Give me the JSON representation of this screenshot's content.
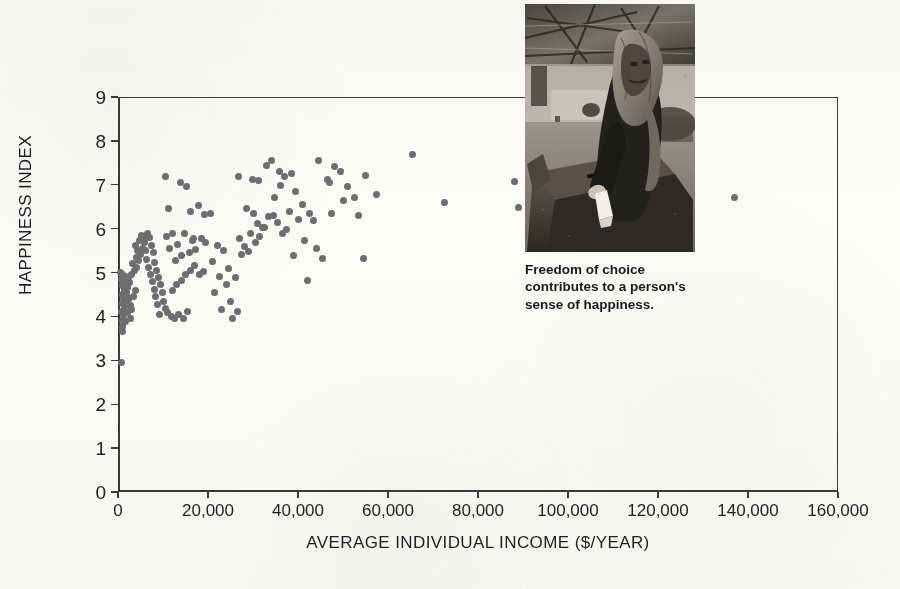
{
  "figure": {
    "photo": {
      "alt_name": "woman-casting-ballot-photo",
      "caption": "Freedom of choice\ncontributes to a person's\nsense of happiness."
    }
  },
  "chart_data": {
    "type": "scatter",
    "title": "",
    "xlabel": "AVERAGE INDIVIDUAL INCOME ($/YEAR)",
    "ylabel": "HAPPINESS INDEX",
    "xlim": [
      0,
      160000
    ],
    "ylim": [
      0,
      9
    ],
    "xticks": [
      0,
      20000,
      40000,
      60000,
      80000,
      100000,
      120000,
      140000,
      160000
    ],
    "xticklabels": [
      "0",
      "20,000",
      "40,000",
      "60,000",
      "80,000",
      "100,000",
      "120,000",
      "140,000",
      "160,000"
    ],
    "yticks": [
      0,
      1,
      2,
      3,
      4,
      5,
      6,
      7,
      8,
      9
    ],
    "yticklabels": [
      "0",
      "1",
      "2",
      "3",
      "4",
      "5",
      "6",
      "7",
      "8",
      "9"
    ],
    "grid": false,
    "legend": false,
    "marker_color": "#6e6e6e",
    "marker_size": 7,
    "points": [
      [
        700,
        2.95
      ],
      [
        900,
        3.65
      ],
      [
        1000,
        3.78
      ],
      [
        1100,
        3.9
      ],
      [
        1200,
        4.02
      ],
      [
        800,
        4.12
      ],
      [
        1400,
        4.2
      ],
      [
        1000,
        4.3
      ],
      [
        1600,
        4.35
      ],
      [
        1200,
        4.42
      ],
      [
        900,
        4.5
      ],
      [
        1800,
        4.55
      ],
      [
        1500,
        4.62
      ],
      [
        1100,
        4.7
      ],
      [
        2000,
        4.72
      ],
      [
        1300,
        4.8
      ],
      [
        800,
        4.85
      ],
      [
        2300,
        4.88
      ],
      [
        1700,
        4.92
      ],
      [
        1000,
        4.96
      ],
      [
        600,
        5.0
      ],
      [
        2600,
        4.78
      ],
      [
        2100,
        4.65
      ],
      [
        1900,
        4.48
      ],
      [
        2400,
        4.38
      ],
      [
        2800,
        4.25
      ],
      [
        2200,
        4.08
      ],
      [
        3100,
        4.15
      ],
      [
        2700,
        3.95
      ],
      [
        1600,
        3.88
      ],
      [
        3400,
        4.45
      ],
      [
        3800,
        4.6
      ],
      [
        3000,
        4.95
      ],
      [
        3600,
        5.05
      ],
      [
        4200,
        5.12
      ],
      [
        3300,
        5.2
      ],
      [
        4600,
        5.28
      ],
      [
        4000,
        5.35
      ],
      [
        5000,
        5.42
      ],
      [
        4400,
        5.5
      ],
      [
        5400,
        5.55
      ],
      [
        3900,
        5.62
      ],
      [
        5800,
        5.68
      ],
      [
        4800,
        5.72
      ],
      [
        6200,
        5.78
      ],
      [
        5200,
        5.85
      ],
      [
        6600,
        5.88
      ],
      [
        7000,
        5.8
      ],
      [
        5600,
        5.72
      ],
      [
        7400,
        5.62
      ],
      [
        6000,
        5.5
      ],
      [
        7800,
        5.45
      ],
      [
        6400,
        5.3
      ],
      [
        8200,
        5.22
      ],
      [
        6800,
        5.12
      ],
      [
        8600,
        5.05
      ],
      [
        7200,
        4.95
      ],
      [
        9000,
        4.88
      ],
      [
        7600,
        4.8
      ],
      [
        9400,
        4.72
      ],
      [
        8000,
        4.62
      ],
      [
        9800,
        4.55
      ],
      [
        8400,
        4.45
      ],
      [
        10200,
        4.35
      ],
      [
        8800,
        4.28
      ],
      [
        10600,
        4.18
      ],
      [
        9200,
        4.05
      ],
      [
        11000,
        4.1
      ],
      [
        11800,
        4.0
      ],
      [
        12500,
        3.95
      ],
      [
        13500,
        4.05
      ],
      [
        14500,
        3.95
      ],
      [
        15500,
        4.12
      ],
      [
        12000,
        4.6
      ],
      [
        13000,
        4.72
      ],
      [
        14000,
        4.82
      ],
      [
        15000,
        4.95
      ],
      [
        16000,
        5.05
      ],
      [
        17000,
        5.15
      ],
      [
        18000,
        4.95
      ],
      [
        19000,
        5.02
      ],
      [
        12800,
        5.28
      ],
      [
        14200,
        5.38
      ],
      [
        15800,
        5.45
      ],
      [
        17200,
        5.52
      ],
      [
        11500,
        5.55
      ],
      [
        13200,
        5.65
      ],
      [
        16500,
        5.72
      ],
      [
        18500,
        5.78
      ],
      [
        10800,
        5.82
      ],
      [
        12200,
        5.88
      ],
      [
        14800,
        5.9
      ],
      [
        16800,
        5.78
      ],
      [
        19500,
        5.68
      ],
      [
        11200,
        6.45
      ],
      [
        10500,
        7.2
      ],
      [
        13800,
        7.05
      ],
      [
        15200,
        6.95
      ],
      [
        17800,
        6.52
      ],
      [
        16200,
        6.38
      ],
      [
        19200,
        6.32
      ],
      [
        20500,
        6.35
      ],
      [
        22000,
        5.62
      ],
      [
        23500,
        5.5
      ],
      [
        21000,
        5.25
      ],
      [
        24500,
        5.1
      ],
      [
        22500,
        4.9
      ],
      [
        26000,
        4.88
      ],
      [
        24000,
        4.72
      ],
      [
        21500,
        4.55
      ],
      [
        25000,
        4.35
      ],
      [
        23000,
        4.15
      ],
      [
        26500,
        4.12
      ],
      [
        25500,
        3.95
      ],
      [
        27500,
        5.42
      ],
      [
        29000,
        5.48
      ],
      [
        28000,
        5.6
      ],
      [
        30500,
        5.68
      ],
      [
        27000,
        5.78
      ],
      [
        31500,
        5.82
      ],
      [
        29500,
        5.9
      ],
      [
        32500,
        6.02
      ],
      [
        31000,
        6.12
      ],
      [
        33500,
        6.28
      ],
      [
        30000,
        6.35
      ],
      [
        34500,
        6.3
      ],
      [
        28500,
        6.45
      ],
      [
        35500,
        6.15
      ],
      [
        32000,
        6.02
      ],
      [
        36500,
        5.88
      ],
      [
        26800,
        7.18
      ],
      [
        29800,
        7.12
      ],
      [
        31200,
        7.1
      ],
      [
        33000,
        7.45
      ],
      [
        34200,
        7.55
      ],
      [
        35800,
        7.3
      ],
      [
        37000,
        7.2
      ],
      [
        38500,
        7.25
      ],
      [
        36200,
        6.98
      ],
      [
        39500,
        6.85
      ],
      [
        34800,
        6.72
      ],
      [
        41000,
        6.55
      ],
      [
        38000,
        6.4
      ],
      [
        42500,
        6.35
      ],
      [
        40000,
        6.22
      ],
      [
        43500,
        6.18
      ],
      [
        37500,
        5.98
      ],
      [
        41500,
        5.72
      ],
      [
        44000,
        5.55
      ],
      [
        39000,
        5.38
      ],
      [
        45500,
        5.32
      ],
      [
        42000,
        4.82
      ],
      [
        46500,
        7.12
      ],
      [
        48000,
        7.42
      ],
      [
        44500,
        7.55
      ],
      [
        49500,
        7.3
      ],
      [
        47000,
        7.05
      ],
      [
        51000,
        6.95
      ],
      [
        50000,
        6.65
      ],
      [
        52500,
        6.72
      ],
      [
        47500,
        6.35
      ],
      [
        53500,
        6.3
      ],
      [
        55000,
        7.22
      ],
      [
        57500,
        6.78
      ],
      [
        54500,
        5.32
      ],
      [
        65500,
        7.68
      ],
      [
        72500,
        6.6
      ],
      [
        88000,
        7.08
      ],
      [
        89000,
        6.48
      ],
      [
        137000,
        6.7
      ]
    ]
  }
}
